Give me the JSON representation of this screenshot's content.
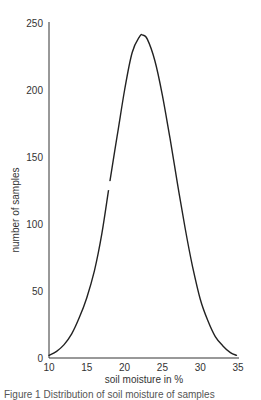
{
  "chart_data": {
    "type": "line",
    "title": "",
    "xlabel": "soil moisture in %",
    "ylabel": "number of samples",
    "xlim": [
      10,
      35
    ],
    "ylim": [
      0,
      250
    ],
    "x_ticks": [
      10,
      15,
      20,
      25,
      30,
      35
    ],
    "y_ticks": [
      0,
      50,
      100,
      150,
      200,
      250
    ],
    "grid": false,
    "legend": null,
    "series": [
      {
        "name": "distribution",
        "x": [
          10,
          11,
          12,
          13,
          14,
          15,
          16,
          17,
          18,
          19,
          20,
          21,
          22,
          22.4,
          23,
          24,
          25,
          26,
          27,
          28,
          29,
          30,
          31,
          32,
          33,
          34,
          34.8
        ],
        "y": [
          2,
          5,
          10,
          18,
          30,
          45,
          65,
          93,
          130,
          165,
          200,
          228,
          240,
          241,
          238,
          222,
          196,
          164,
          130,
          97,
          68,
          44,
          28,
          16,
          9,
          4,
          2
        ]
      }
    ],
    "annotations": [
      "gap in curve near x≈17.8 (y≈120-135)"
    ],
    "color": "#222222"
  },
  "caption": "Figure 1  Distribution of soil moisture of samples"
}
